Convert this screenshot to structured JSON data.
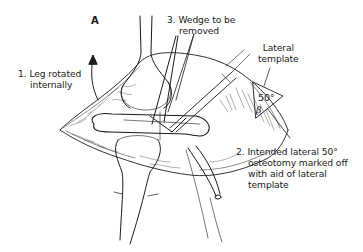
{
  "figure": {
    "panel_label": "A",
    "annotations": {
      "leg_rotated": {
        "line1": "1. Leg rotated",
        "line2": "internally"
      },
      "wedge": {
        "line1": "3. Wedge to be",
        "line2": "removed"
      },
      "template_label": {
        "line1": "Lateral",
        "line2": "template"
      },
      "osteotomy": {
        "line1": "2. Intended lateral 50°",
        "line2": "osteotomy marked off",
        "line3": "with aid of lateral",
        "line4": "template"
      }
    },
    "template": {
      "angle": "50°",
      "symbol": "β"
    },
    "colors": {
      "ink": "#1a1a1a",
      "background": "#ffffff"
    }
  }
}
